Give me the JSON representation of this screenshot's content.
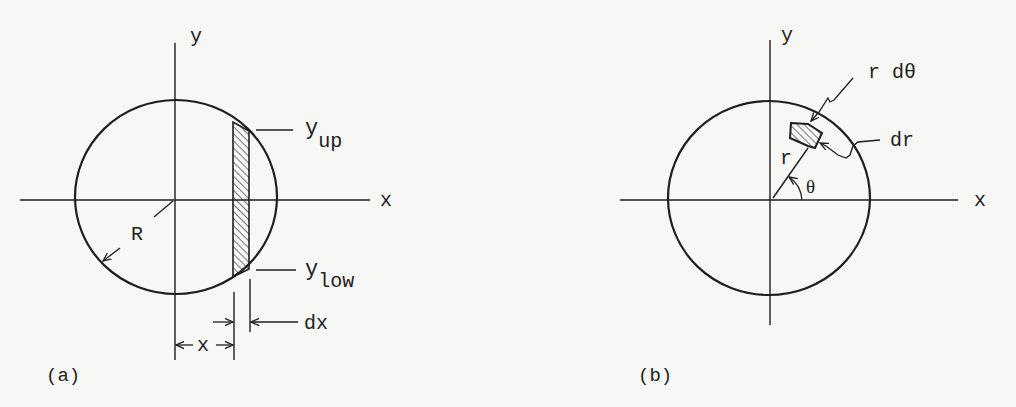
{
  "figure": {
    "background": "#f7f7f5",
    "ink": "#1e1e1e"
  },
  "panel_a": {
    "caption": "(a)",
    "axis_x_label": "x",
    "axis_y_label": "y",
    "radius_label": "R",
    "upper_bound_label": "y",
    "upper_bound_sub": "up",
    "lower_bound_label": "y",
    "lower_bound_sub": "low",
    "strip_width_label": "dx",
    "strip_position_label": "x",
    "description": "Circle of radius R with vertical hatched strip of width dx at position x, bounded by y_low and y_up"
  },
  "panel_b": {
    "caption": "(b)",
    "axis_x_label": "x",
    "axis_y_label": "y",
    "radius_label": "r",
    "angle_label": "θ",
    "arc_element_label": "r dθ",
    "radial_element_label": "dr",
    "description": "Circle with polar area element at radius r and angle θ, with sides r dθ and dr"
  }
}
